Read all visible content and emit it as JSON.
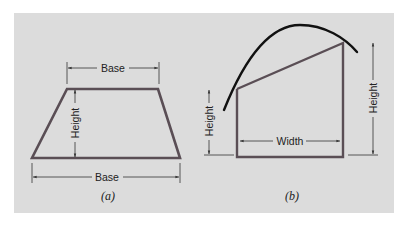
{
  "figure": {
    "panel_a": {
      "caption": "(a)",
      "shape": "trapezoid",
      "labels": {
        "top_base": "Base",
        "height": "Height",
        "bottom_base": "Base"
      }
    },
    "panel_b": {
      "caption": "(b)",
      "shape": "strip under curve with trapezoidal approximation",
      "labels": {
        "left_height": "Height",
        "width": "Width",
        "right_height": "Height"
      }
    },
    "colors": {
      "panel_bg": "#dcdcdc",
      "shape_stroke": "#5a4e55",
      "curve_stroke": "#111111",
      "dimension_line": "#333333"
    }
  }
}
